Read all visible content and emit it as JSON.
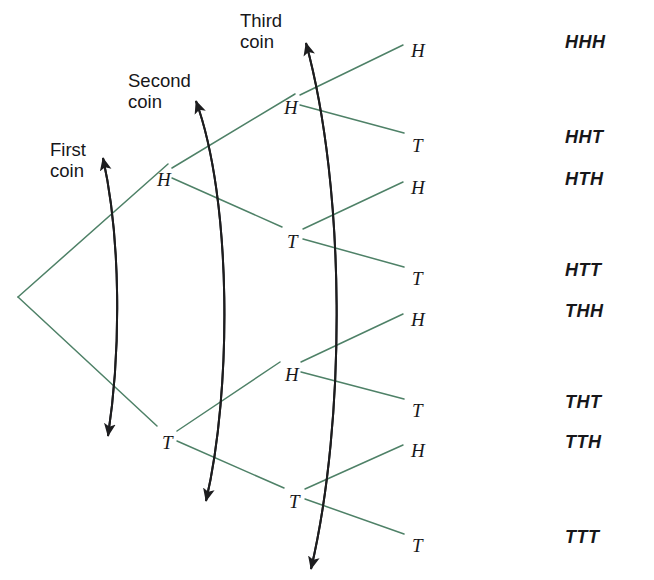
{
  "figure": {
    "type": "probability-tree-diagram",
    "colors": {
      "branch_line": "#4e8167",
      "arrow": "#1d1d1f",
      "text": "#17171a",
      "background": "#ffffff"
    },
    "width": 654,
    "height": 580
  },
  "stage_labels": [
    {
      "id": "first-coin",
      "text": "First\ncoin",
      "x": 50,
      "y": 139
    },
    {
      "id": "second-coin",
      "text": "Second\ncoin",
      "x": 128,
      "y": 70
    },
    {
      "id": "third-coin",
      "text": "Third\ncoin",
      "x": 240,
      "y": 10
    }
  ],
  "root": {
    "id": "root",
    "x": 18,
    "y": 297
  },
  "nodes": [
    {
      "id": "n-H",
      "label": "H",
      "level": 1,
      "x": 157,
      "y": 170,
      "join_x": 170,
      "join_y": 173
    },
    {
      "id": "n-T",
      "label": "T",
      "level": 1,
      "x": 162,
      "y": 433,
      "join_x": 175,
      "join_y": 436
    },
    {
      "id": "n-HH",
      "label": "H",
      "level": 2,
      "x": 284,
      "y": 98,
      "join_x": 297,
      "join_y": 101
    },
    {
      "id": "n-HT",
      "label": "T",
      "level": 2,
      "x": 287,
      "y": 232,
      "join_x": 300,
      "join_y": 235
    },
    {
      "id": "n-TH",
      "label": "H",
      "level": 2,
      "x": 285,
      "y": 365,
      "join_x": 298,
      "join_y": 368
    },
    {
      "id": "n-TT",
      "label": "T",
      "level": 2,
      "x": 289,
      "y": 492,
      "join_x": 302,
      "join_y": 495
    },
    {
      "id": "n-HHH",
      "label": "H",
      "level": 3,
      "x": 411,
      "y": 41,
      "join_x": 405,
      "join_y": 46
    },
    {
      "id": "n-HHT",
      "label": "T",
      "level": 3,
      "x": 412,
      "y": 136,
      "join_x": 406,
      "join_y": 141
    },
    {
      "id": "n-HTH",
      "label": "H",
      "level": 3,
      "x": 411,
      "y": 178,
      "join_x": 405,
      "join_y": 183
    },
    {
      "id": "n-HTT",
      "label": "T",
      "level": 3,
      "x": 412,
      "y": 269,
      "join_x": 406,
      "join_y": 274
    },
    {
      "id": "n-THH",
      "label": "H",
      "level": 3,
      "x": 411,
      "y": 310,
      "join_x": 405,
      "join_y": 315
    },
    {
      "id": "n-THT",
      "label": "T",
      "level": 3,
      "x": 412,
      "y": 401,
      "join_x": 406,
      "join_y": 406
    },
    {
      "id": "n-TTH",
      "label": "H",
      "level": 3,
      "x": 411,
      "y": 441,
      "join_x": 405,
      "join_y": 446
    },
    {
      "id": "n-TTT",
      "label": "T",
      "level": 3,
      "x": 412,
      "y": 536,
      "join_x": 406,
      "join_y": 541
    }
  ],
  "branches": [
    {
      "id": "b-root-H",
      "from": "root",
      "to": "n-H",
      "x1": 18,
      "y1": 297,
      "x2": 168,
      "y2": 164
    },
    {
      "id": "b-root-T",
      "from": "root",
      "to": "n-T",
      "x1": 18,
      "y1": 297,
      "x2": 157,
      "y2": 426
    },
    {
      "id": "b-H-HH",
      "from": "n-H",
      "to": "n-HH",
      "x1": 172,
      "y1": 168,
      "x2": 295,
      "y2": 94
    },
    {
      "id": "b-H-HT",
      "from": "n-H",
      "to": "n-HT",
      "x1": 172,
      "y1": 178,
      "x2": 282,
      "y2": 227
    },
    {
      "id": "b-T-TH",
      "from": "n-T",
      "to": "n-TH",
      "x1": 177,
      "y1": 431,
      "x2": 280,
      "y2": 362
    },
    {
      "id": "b-T-TT",
      "from": "n-T",
      "to": "n-TT",
      "x1": 177,
      "y1": 441,
      "x2": 284,
      "y2": 488
    },
    {
      "id": "b-HH-HHH",
      "from": "n-HH",
      "to": "n-HHH",
      "x1": 300,
      "y1": 95,
      "x2": 403,
      "y2": 45
    },
    {
      "id": "b-HH-HHT",
      "from": "n-HH",
      "to": "n-HHT",
      "x1": 300,
      "y1": 105,
      "x2": 404,
      "y2": 133
    },
    {
      "id": "b-HT-HTH",
      "from": "n-HT",
      "to": "n-HTH",
      "x1": 303,
      "y1": 229,
      "x2": 403,
      "y2": 182
    },
    {
      "id": "b-HT-HTT",
      "from": "n-HT",
      "to": "n-HTT",
      "x1": 303,
      "y1": 239,
      "x2": 404,
      "y2": 267
    },
    {
      "id": "b-TH-THH",
      "from": "n-TH",
      "to": "n-THH",
      "x1": 301,
      "y1": 362,
      "x2": 403,
      "y2": 314
    },
    {
      "id": "b-TH-THT",
      "from": "n-TH",
      "to": "n-THT",
      "x1": 301,
      "y1": 372,
      "x2": 404,
      "y2": 399
    },
    {
      "id": "b-TT-TTH",
      "from": "n-TT",
      "to": "n-TTH",
      "x1": 305,
      "y1": 489,
      "x2": 403,
      "y2": 445
    },
    {
      "id": "b-TT-TTT",
      "from": "n-TT",
      "to": "n-TTT",
      "x1": 305,
      "y1": 499,
      "x2": 404,
      "y2": 534
    }
  ],
  "stage_arrows": [
    {
      "id": "arrow-first-coin",
      "path": "M 103,158 C 121,240 121,350 108,436"
    },
    {
      "id": "arrow-second-coin",
      "path": "M 196,101 C 232,200 232,390 206,501"
    },
    {
      "id": "arrow-third-coin",
      "path": "M 306,43 C 346,190 346,420 311,569"
    }
  ],
  "outcomes": [
    {
      "id": "outcome-HHH",
      "text": "HHH",
      "x": 565,
      "y": 33
    },
    {
      "id": "outcome-HHT",
      "text": "HHT",
      "x": 565,
      "y": 128
    },
    {
      "id": "outcome-HTH",
      "text": "HTH",
      "x": 565,
      "y": 170
    },
    {
      "id": "outcome-HTT",
      "text": "HTT",
      "x": 565,
      "y": 261
    },
    {
      "id": "outcome-THH",
      "text": "THH",
      "x": 565,
      "y": 302
    },
    {
      "id": "outcome-THT",
      "text": "THT",
      "x": 565,
      "y": 393
    },
    {
      "id": "outcome-TTH",
      "text": "TTH",
      "x": 565,
      "y": 433
    },
    {
      "id": "outcome-TTT",
      "text": "TTT",
      "x": 565,
      "y": 528
    }
  ]
}
